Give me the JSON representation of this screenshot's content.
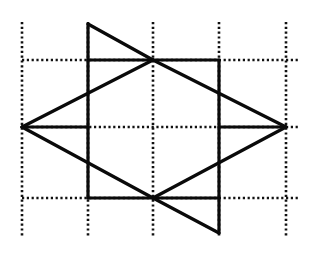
{
  "diagram": {
    "canvas": {
      "width": 314,
      "height": 253,
      "background": "#ffffff",
      "ink": "#0a0a0a"
    },
    "grid": {
      "style": "dotted",
      "vertical_x": [
        22,
        88,
        153,
        219,
        286
      ],
      "vertical_y_range": [
        22,
        238
      ],
      "horizontal_y": [
        60,
        127,
        198
      ],
      "horizontal_x_range": [
        22,
        300
      ]
    },
    "solid_segments": [
      {
        "name": "top-triangle-vertical",
        "x1": 88,
        "y1": 24,
        "x2": 88,
        "y2": 198
      },
      {
        "name": "top-triangle-hypotenuse",
        "x1": 88,
        "y1": 24,
        "x2": 153,
        "y2": 60
      },
      {
        "name": "top-horizontal",
        "x1": 88,
        "y1": 60,
        "x2": 219,
        "y2": 60
      },
      {
        "name": "rhombus-upper-left",
        "x1": 153,
        "y1": 60,
        "x2": 22,
        "y2": 127
      },
      {
        "name": "rhombus-upper-right",
        "x1": 153,
        "y1": 60,
        "x2": 286,
        "y2": 127
      },
      {
        "name": "rhombus-lower-left",
        "x1": 22,
        "y1": 127,
        "x2": 153,
        "y2": 198
      },
      {
        "name": "rhombus-lower-right",
        "x1": 286,
        "y1": 127,
        "x2": 153,
        "y2": 198
      },
      {
        "name": "middle-left-horizontal",
        "x1": 22,
        "y1": 127,
        "x2": 88,
        "y2": 127
      },
      {
        "name": "middle-right-horizontal",
        "x1": 219,
        "y1": 127,
        "x2": 286,
        "y2": 127
      },
      {
        "name": "bottom-horizontal",
        "x1": 88,
        "y1": 198,
        "x2": 219,
        "y2": 198
      },
      {
        "name": "bottom-triangle-vertical",
        "x1": 219,
        "y1": 60,
        "x2": 219,
        "y2": 233
      },
      {
        "name": "bottom-triangle-hypotenuse",
        "x1": 153,
        "y1": 198,
        "x2": 219,
        "y2": 233
      }
    ],
    "labels": []
  }
}
